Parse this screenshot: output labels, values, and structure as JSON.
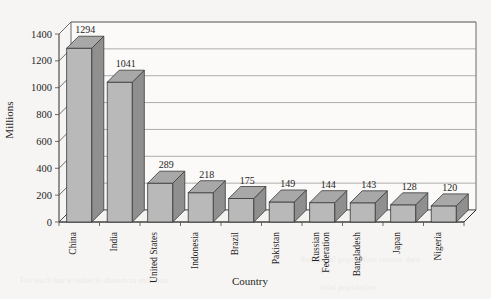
{
  "chart_data": {
    "type": "bar",
    "title": "",
    "subtitle": "",
    "xlabel": "Country",
    "ylabel": "Millions",
    "categories": [
      "China",
      "India",
      "United States",
      "Indonesia",
      "Brazil",
      "Pakistan",
      "Russian Federation",
      "Bangladesh",
      "Japan",
      "Nigeria"
    ],
    "values": [
      1294,
      1041,
      289,
      218,
      175,
      149,
      144,
      143,
      128,
      120
    ],
    "data_labels": [
      "1294",
      "1041",
      "289",
      "218",
      "175",
      "149",
      "144",
      "143",
      "128",
      "120"
    ],
    "ylim": [
      0,
      1400
    ],
    "ytick_values": [
      0,
      200,
      400,
      600,
      800,
      1000,
      1200,
      1400
    ],
    "ytick_labels": [
      "0",
      "200",
      "400",
      "600",
      "800",
      "1000",
      "1200",
      "1400"
    ],
    "grid": true,
    "grid_axis": "y",
    "legend": false,
    "legend_position": "none",
    "style": "3d-column",
    "bar_color": "#b9b9b9",
    "bar_side_color": "#8f8f8f",
    "bar_top_color": "#a8a8a8",
    "plot_background": "#fbfaf8",
    "page_background": "#f6f5f3",
    "axis_color": "#2e2e2e",
    "gridline_color": "#8c8c8c"
  },
  "axes": {
    "y_axis_title": "Millions",
    "x_axis_title": "Country"
  }
}
